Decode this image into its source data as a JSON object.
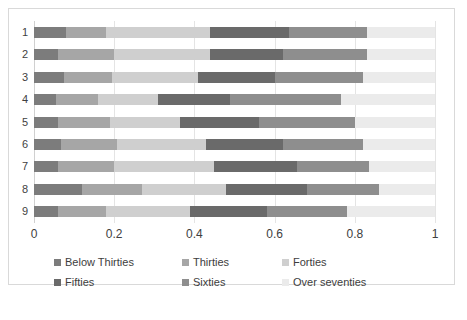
{
  "chart_data": {
    "type": "bar",
    "orientation": "horizontal",
    "stacked": true,
    "normalized": true,
    "title": "",
    "xlabel": "",
    "ylabel": "",
    "xlim": [
      0,
      1
    ],
    "xticks": [
      "0",
      "0.2",
      "0.4",
      "0.6",
      "0.8",
      "1"
    ],
    "xtick_values": [
      0,
      0.2,
      0.4,
      0.6,
      0.8,
      1
    ],
    "grid": true,
    "grid_axis": "x",
    "legend_position": "bottom",
    "categories": [
      "1",
      "2",
      "3",
      "4",
      "5",
      "6",
      "7",
      "8",
      "9"
    ],
    "series": [
      {
        "name": "Below Thirties",
        "color": "#7c7c7c",
        "values": [
          0.08,
          0.06,
          0.075,
          0.055,
          0.06,
          0.067,
          0.06,
          0.12,
          0.06
        ]
      },
      {
        "name": "Thirties",
        "color": "#a6a6a6",
        "values": [
          0.1,
          0.14,
          0.12,
          0.105,
          0.13,
          0.14,
          0.14,
          0.15,
          0.12
        ]
      },
      {
        "name": "Forties",
        "color": "#cfcfcf",
        "values": [
          0.26,
          0.24,
          0.215,
          0.15,
          0.175,
          0.223,
          0.25,
          0.21,
          0.21
        ]
      },
      {
        "name": "Fifties",
        "color": "#6a6a6a",
        "values": [
          0.195,
          0.18,
          0.19,
          0.18,
          0.195,
          0.19,
          0.205,
          0.2,
          0.19
        ]
      },
      {
        "name": "Sixties",
        "color": "#8e8e8e",
        "values": [
          0.195,
          0.21,
          0.22,
          0.275,
          0.24,
          0.2,
          0.18,
          0.18,
          0.2
        ]
      },
      {
        "name": "Over seventies",
        "color": "#ebebeb",
        "values": [
          0.17,
          0.17,
          0.18,
          0.235,
          0.2,
          0.18,
          0.165,
          0.14,
          0.22
        ]
      }
    ],
    "legend_labels": [
      "Below Thirties",
      "Thirties",
      "Forties",
      "Fifties",
      "Sixties",
      "Over seventies"
    ]
  }
}
